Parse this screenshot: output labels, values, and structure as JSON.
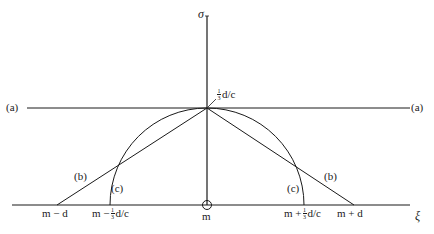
{
  "diagram": {
    "axes": {
      "vertical_label": "σ",
      "horizontal_label": "ξ",
      "origin_label": "m"
    },
    "lines": {
      "a_left": "(a)",
      "a_right": "(a)",
      "b_left": "(b)",
      "b_right": "(b)",
      "c_left": "(c)",
      "c_right": "(c)"
    },
    "apex_label": {
      "frac_num": "1",
      "frac_den": "3",
      "suffix": "d/c"
    },
    "baseline_ticks": {
      "m_minus_d": "m − d",
      "m_minus_frac": {
        "prefix": "m −",
        "frac_num": "1",
        "frac_den": "3",
        "suffix": "d/c"
      },
      "m_plus_frac": {
        "prefix": "m +",
        "frac_num": "1",
        "frac_den": "3",
        "suffix": "d/c"
      },
      "m_plus_d": "m + d"
    },
    "colors": {
      "ink": "#1a1a1a",
      "background": "#ffffff"
    }
  }
}
